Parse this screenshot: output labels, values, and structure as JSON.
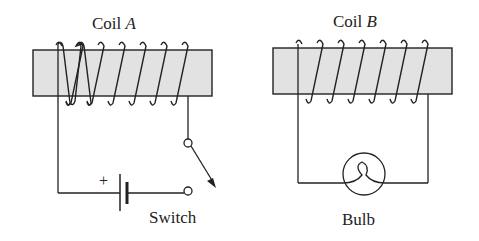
{
  "coil_a": {
    "label": "Coil",
    "letter": "A"
  },
  "coil_b": {
    "label": "Coil",
    "letter": "B"
  },
  "battery": {
    "polarity_label": "+"
  },
  "switch": {
    "label": "Switch"
  },
  "bulb": {
    "label": "Bulb"
  },
  "colors": {
    "core_fill": "#e0e0e0",
    "line": "#222222"
  }
}
